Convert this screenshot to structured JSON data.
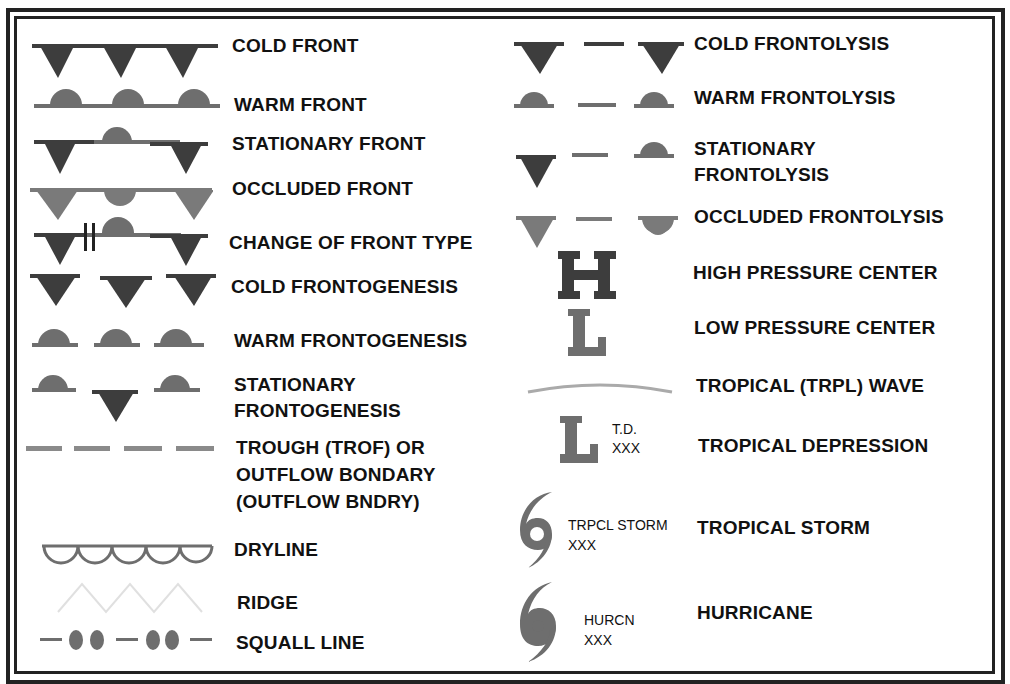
{
  "colors": {
    "dark_symbol": "#3d3d3d",
    "mid_symbol": "#6e6e6e",
    "light_symbol": "#8a8a8a",
    "ridge": "#e0e0e0",
    "wave": "#aaaaaa",
    "border": "#222222",
    "text": "#111111"
  },
  "left_column": [
    {
      "id": "cold-front",
      "label": "COLD FRONT"
    },
    {
      "id": "warm-front",
      "label": "WARM FRONT"
    },
    {
      "id": "stationary-front",
      "label": "STATIONARY FRONT"
    },
    {
      "id": "occluded-front",
      "label": "OCCLUDED FRONT"
    },
    {
      "id": "change-of-front-type",
      "label": "CHANGE OF FRONT TYPE"
    },
    {
      "id": "cold-frontogenesis",
      "label": "COLD FRONTOGENESIS"
    },
    {
      "id": "warm-frontogenesis",
      "label": "WARM FRONTOGENESIS"
    },
    {
      "id": "stationary-frontogenesis",
      "label_line1": "STATIONARY",
      "label_line2": "FRONTOGENESIS"
    },
    {
      "id": "trough",
      "label_line1": "TROUGH (TROF) OR",
      "label_line2": "OUTFLOW BONDARY",
      "label_line3": "(OUTFLOW BNDRY)"
    },
    {
      "id": "dryline",
      "label": "DRYLINE"
    },
    {
      "id": "ridge",
      "label": "RIDGE"
    },
    {
      "id": "squall-line",
      "label": "SQUALL LINE"
    }
  ],
  "right_column": [
    {
      "id": "cold-frontolysis",
      "label": "COLD FRONTOLYSIS"
    },
    {
      "id": "warm-frontolysis",
      "label": "WARM FRONTOLYSIS"
    },
    {
      "id": "stationary-frontolysis",
      "label_line1": "STATIONARY",
      "label_line2": "FRONTOLYSIS"
    },
    {
      "id": "occluded-frontolysis",
      "label": "OCCLUDED FRONTOLYSIS"
    },
    {
      "id": "high-pressure-center",
      "label": "HIGH PRESSURE CENTER",
      "glyph": "H"
    },
    {
      "id": "low-pressure-center",
      "label": "LOW PRESSURE CENTER",
      "glyph": "L"
    },
    {
      "id": "tropical-wave",
      "label": "TROPICAL (TRPL) WAVE"
    },
    {
      "id": "tropical-depression",
      "label": "TROPICAL DEPRESSION",
      "glyph": "L",
      "annotation_line1": "T.D.",
      "annotation_line2": "XXX"
    },
    {
      "id": "tropical-storm",
      "label": "TROPICAL STORM",
      "annotation_line1": "TRPCL STORM",
      "annotation_line2": "XXX"
    },
    {
      "id": "hurricane",
      "label": "HURRICANE",
      "annotation_line1": "HURCN",
      "annotation_line2": "XXX"
    }
  ]
}
